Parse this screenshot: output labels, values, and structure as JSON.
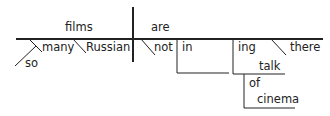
{
  "diagram": {
    "type": "sentence-diagram",
    "words": {
      "subject": "films",
      "verb": "are",
      "mod_many": "many",
      "mod_so": "so",
      "mod_russian": "Russian",
      "mod_not": "not",
      "prep_in": "in",
      "gerund_suffix": "ing",
      "gerund_stem": "talk",
      "mod_there": "there",
      "prep_of": "of",
      "obj_cinema": "cinema"
    },
    "colors": {
      "line": "#222222",
      "text": "#222222"
    }
  }
}
